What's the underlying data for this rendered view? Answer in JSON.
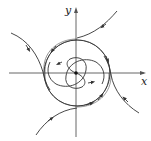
{
  "figure": {
    "type": "phase-portrait",
    "axes": {
      "x_label": "x",
      "y_label": "y",
      "origin": [
        76,
        73
      ]
    },
    "colors": {
      "stroke": "#333333",
      "axis": "#555555",
      "background": "#ffffff"
    },
    "elements": {
      "limit_cycle": "closed orbit",
      "origin_point": "equilibrium (unstable focus)",
      "inner_trajectories": 2,
      "outer_trajectories": 4
    }
  }
}
